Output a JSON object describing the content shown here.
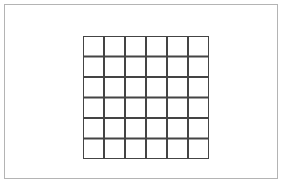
{
  "figure": {
    "background_color": "#ffffff",
    "frame": {
      "name": "outer-border",
      "color": "#b4b4b4",
      "stroke_width": 1,
      "x": 4,
      "y": 4,
      "width": 274,
      "height": 175
    },
    "grid": {
      "name": "square-lattice-grid",
      "columns": 6,
      "rows": 6,
      "cell_count": 36,
      "line_color": "#444444",
      "line_width": 2,
      "cell_fill": "#ffffff",
      "x": 78,
      "y": 31,
      "width": 126,
      "height": 123,
      "cell_width": 21,
      "cell_height": 20.5,
      "vertical_line_positions": [
        0,
        21,
        42,
        63,
        84,
        105,
        126
      ],
      "horizontal_line_positions": [
        0,
        20.5,
        41,
        61.5,
        82,
        102.5,
        123
      ]
    }
  }
}
